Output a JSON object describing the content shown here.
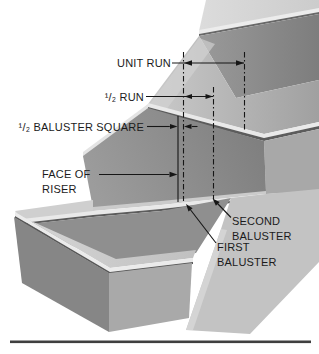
{
  "figure": {
    "labels": {
      "unit_run": "UNIT RUN",
      "half_run": "¹/₂ RUN",
      "half_baluster_square": "¹/₂ BALUSTER SQUARE",
      "face_of_riser_line1": "FACE OF",
      "face_of_riser_line2": "RISER",
      "second_baluster_line1": "SECOND",
      "second_baluster_line2": "BALUSTER",
      "first_baluster_line1": "FIRST",
      "first_baluster_line2": "BALUSTER"
    },
    "colors": {
      "background": "#ffffff",
      "annotation_line": "#161616",
      "tread_gray": "#c7c7c7",
      "riser_gray": "#8d8d8d",
      "nosing_trim": "#e9e9e9",
      "side_wall": "#c3c3c3",
      "ground_line": "#3f3f3f"
    }
  }
}
